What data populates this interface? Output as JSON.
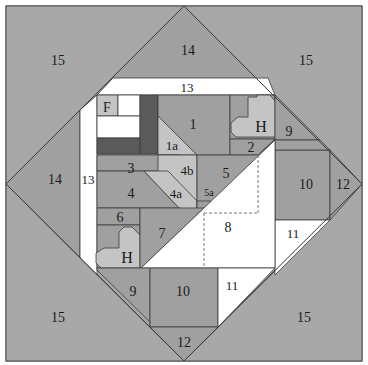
{
  "diagram": {
    "colors": {
      "background": "#a8a8a8",
      "medium_gray": "#a0a0a0",
      "light_gray": "#c4c4c4",
      "dark_gray": "#5a5a5a",
      "white": "#ffffff",
      "line": "#3a3a3a",
      "dashed": "#777777"
    },
    "pieces": [
      {
        "id": "15-tl",
        "label": "15",
        "fill": "background",
        "points": "6,6 184,6 6,184",
        "lx": 58,
        "ly": 65,
        "fs": 14
      },
      {
        "id": "15-tr",
        "label": "15",
        "fill": "background",
        "points": "184,6 362,6 362,184",
        "lx": 306,
        "ly": 65,
        "fs": 14
      },
      {
        "id": "15-bl",
        "label": "15",
        "fill": "background",
        "points": "6,184 6,361 184,361",
        "lx": 58,
        "ly": 322,
        "fs": 14
      },
      {
        "id": "15-br",
        "label": "15",
        "fill": "background",
        "points": "362,184 362,361 184,361",
        "lx": 304,
        "ly": 322,
        "fs": 14
      },
      {
        "id": "14-top",
        "label": "14",
        "fill": "medium_gray",
        "points": "184,6 263,85 105,85",
        "lx": 188,
        "ly": 55,
        "fs": 14
      },
      {
        "id": "14-left",
        "label": "14",
        "fill": "medium_gray",
        "points": "6,184 80,110 80,258",
        "lx": 55,
        "ly": 184,
        "fs": 14
      },
      {
        "id": "13-top",
        "label": "13",
        "fill": "white",
        "points": "113,78 268,78 275,95 97,95",
        "lx": 187,
        "ly": 92,
        "fs": 13
      },
      {
        "id": "13-left",
        "label": "13",
        "fill": "white",
        "points": "80,110 97,95 97,275 80,258",
        "lx": 88,
        "ly": 184,
        "fs": 13
      },
      {
        "id": "F",
        "label": "F",
        "fill": "light_gray",
        "points": "97,95 118,95 118,116 97,116",
        "lx": 107,
        "ly": 112,
        "fs": 14
      },
      {
        "id": "white-top",
        "label": "",
        "fill": "white",
        "points": "118,95 140,95 140,116 118,116",
        "lx": 0,
        "ly": 0,
        "fs": 0
      },
      {
        "id": "white-mid",
        "label": "",
        "fill": "white",
        "points": "97,116 140,116 140,138 97,138",
        "lx": 0,
        "ly": 0,
        "fs": 0
      },
      {
        "id": "dark-vert",
        "label": "",
        "fill": "dark_gray",
        "points": "140,95 158,95 158,154 140,154",
        "lx": 0,
        "ly": 0,
        "fs": 0
      },
      {
        "id": "dark-horiz",
        "label": "",
        "fill": "dark_gray",
        "points": "97,138 140,138 140,154 97,154",
        "lx": 0,
        "ly": 0,
        "fs": 0
      },
      {
        "id": "1",
        "label": "1",
        "fill": "medium_gray",
        "points": "158,95 230,95 230,155 197,155 158,116",
        "lx": 193,
        "ly": 129,
        "fs": 14
      },
      {
        "id": "1a",
        "label": "1a",
        "fill": "light_gray",
        "points": "158,116 197,155 158,155",
        "lx": 172,
        "ly": 150,
        "fs": 13
      },
      {
        "id": "H-top-bg",
        "label": "",
        "fill": "medium_gray",
        "points": "230,95 275,95 275,139 230,139",
        "lx": 0,
        "ly": 0,
        "fs": 0
      },
      {
        "id": "H-top",
        "label": "H",
        "fill": "light_gray",
        "points": "248,97 257,97 257,95 270,95 275,101 275,137 236,137 231,132 231,123 238,117 248,117",
        "lx": 261,
        "ly": 132,
        "fs": 16
      },
      {
        "id": "2",
        "label": "2",
        "fill": "medium_gray",
        "points": "230,139 275,139 258,155 230,155",
        "lx": 251,
        "ly": 152,
        "fs": 14
      },
      {
        "id": "9-top",
        "label": "9",
        "fill": "medium_gray",
        "points": "275,95 320,140 275,140",
        "lx": 289,
        "ly": 136,
        "fs": 14
      },
      {
        "id": "10-right",
        "label": "10",
        "fill": "medium_gray",
        "points": "275,150 330,150 330,220 275,220",
        "lx": 306,
        "ly": 189,
        "fs": 14
      },
      {
        "id": "12-right",
        "label": "12",
        "fill": "medium_gray",
        "points": "330,150 362,184 330,220",
        "lx": 343,
        "ly": 189,
        "fs": 14
      },
      {
        "id": "9-right-fill",
        "label": "",
        "fill": "medium_gray",
        "points": "275,140 320,140 330,150 275,150",
        "lx": 0,
        "ly": 0,
        "fs": 0
      },
      {
        "id": "11-right",
        "label": "11",
        "fill": "white",
        "points": "275,220 330,220 275,275",
        "lx": 293,
        "ly": 238,
        "fs": 13
      },
      {
        "id": "3",
        "label": "3",
        "fill": "medium_gray",
        "points": "97,155 180,155 198,171 97,171",
        "lx": 131,
        "ly": 173,
        "fs": 14
      },
      {
        "id": "4b",
        "label": "4b",
        "fill": "light_gray",
        "points": "158,155 197,155 197,210 180,210 180,193 158,171",
        "lx": 187,
        "ly": 175,
        "fs": 13
      },
      {
        "id": "4",
        "label": "4",
        "fill": "medium_gray",
        "points": "97,171 144,171 179,208 97,208",
        "lx": 131,
        "ly": 198,
        "fs": 14
      },
      {
        "id": "4a",
        "label": "4a",
        "fill": "light_gray",
        "points": "144,171 168,171 197,201 197,210 179,208",
        "lx": 176,
        "ly": 198,
        "fs": 13
      },
      {
        "id": "5",
        "label": "5",
        "fill": "medium_gray",
        "points": "197,155 258,155 275,140 202,213 197,213",
        "lx": 226,
        "ly": 178,
        "fs": 14
      },
      {
        "id": "5a",
        "label": "5a",
        "fill": "medium_gray",
        "points": "197,201 211,201 202,213 197,213",
        "lx": 209,
        "ly": 196,
        "fs": 10
      },
      {
        "id": "6",
        "label": "6",
        "fill": "medium_gray",
        "points": "97,208 140,208 140,225 97,225",
        "lx": 120,
        "ly": 222,
        "fs": 14
      },
      {
        "id": "H-bottom-bg",
        "label": "",
        "fill": "medium_gray",
        "points": "97,225 140,225 140,268 97,268",
        "lx": 0,
        "ly": 0,
        "fs": 0
      },
      {
        "id": "H-bottom",
        "label": "H",
        "fill": "light_gray",
        "points": "124,227 132,227 140,235 140,268 101,268 96,263 96,253 104,248 119,248 119,232",
        "lx": 127,
        "ly": 263,
        "fs": 16
      },
      {
        "id": "7",
        "label": "7",
        "fill": "medium_gray",
        "points": "140,208 204,208 141,268 140,268",
        "lx": 162,
        "ly": 238,
        "fs": 14
      },
      {
        "id": "8",
        "label": "8",
        "fill": "white",
        "points": "204,208 275,140 275,268 141,268",
        "lx": 228,
        "ly": 232,
        "fs": 14
      },
      {
        "id": "9-bottom",
        "label": "9",
        "fill": "medium_gray",
        "points": "97,268 150,268 150,327 155,327 97,270",
        "lx": 133,
        "ly": 296,
        "fs": 14
      },
      {
        "id": "10-bottom",
        "label": "10",
        "fill": "medium_gray",
        "points": "150,268 218,268 218,327 150,327",
        "lx": 183,
        "ly": 296,
        "fs": 14
      },
      {
        "id": "11-bottom",
        "label": "11",
        "fill": "white",
        "points": "218,268 275,268 218,327",
        "lx": 232,
        "ly": 290,
        "fs": 13
      },
      {
        "id": "12-bottom",
        "label": "12",
        "fill": "medium_gray",
        "points": "150,327 218,327 184,361",
        "lx": 184,
        "ly": 347,
        "fs": 14
      }
    ],
    "dashed_lines": [
      {
        "x1": 204,
        "y1": 213,
        "x2": 204,
        "y2": 268
      },
      {
        "x1": 204,
        "y1": 213,
        "x2": 258,
        "y2": 213
      },
      {
        "x1": 258,
        "y1": 155,
        "x2": 258,
        "y2": 213
      }
    ]
  }
}
